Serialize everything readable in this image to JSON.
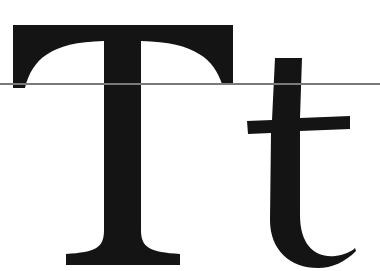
{
  "specimen": {
    "text": "Tt",
    "uppercase": "T",
    "lowercase": "t",
    "glyph_color": "#141414",
    "background_color": "#ffffff"
  },
  "guide": {
    "label": "reference line",
    "color": "#7a7a7a"
  }
}
